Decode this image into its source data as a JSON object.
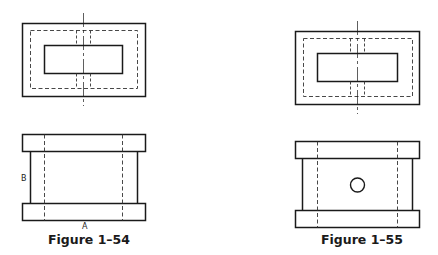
{
  "figures": [
    {
      "id": "fig-1-54",
      "caption": "Figure 1–54",
      "labels": {
        "a": "A",
        "b": "B"
      }
    },
    {
      "id": "fig-1-55",
      "caption": "Figure 1–55"
    }
  ],
  "colors": {
    "line": "#1a1a1a",
    "hidden_line": "#333333",
    "background": "#ffffff"
  }
}
